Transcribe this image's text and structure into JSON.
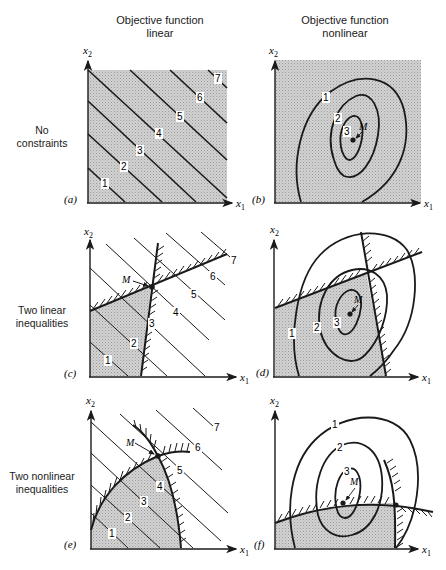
{
  "figure": {
    "column_headers": [
      {
        "line1": "Objective function",
        "line2": "linear"
      },
      {
        "line1": "Objective function",
        "line2": "nonlinear"
      }
    ],
    "row_headers": [
      {
        "line1": "No",
        "line2": "constraints"
      },
      {
        "line1": "Two linear",
        "line2": "inequalities"
      },
      {
        "line1": "Two nonlinear",
        "line2": "inequalities"
      }
    ],
    "axis_labels": {
      "x": "x",
      "x_sub": "1",
      "y": "x",
      "y_sub": "2"
    },
    "optimum_label": "M",
    "panels": [
      {
        "id": "a",
        "label": "(a)",
        "objective": "linear",
        "constraints": "none",
        "contour_labels": [
          "1",
          "2",
          "3",
          "4",
          "5",
          "6",
          "7"
        ]
      },
      {
        "id": "b",
        "label": "(b)",
        "objective": "nonlinear",
        "constraints": "none",
        "contour_labels": [
          "1",
          "2",
          "3"
        ]
      },
      {
        "id": "c",
        "label": "(c)",
        "objective": "linear",
        "constraints": "two linear inequalities",
        "contour_labels": [
          "1",
          "2",
          "3",
          "4",
          "5",
          "6",
          "7"
        ]
      },
      {
        "id": "d",
        "label": "(d)",
        "objective": "nonlinear",
        "constraints": "two linear inequalities",
        "contour_labels": [
          "1",
          "2",
          "3"
        ]
      },
      {
        "id": "e",
        "label": "(e)",
        "objective": "linear",
        "constraints": "two nonlinear inequalities",
        "contour_labels": [
          "1",
          "2",
          "3",
          "4",
          "5",
          "6",
          "7"
        ]
      },
      {
        "id": "f",
        "label": "(f)",
        "objective": "nonlinear",
        "constraints": "two nonlinear inequalities",
        "contour_labels": [
          "1",
          "2",
          "3"
        ]
      }
    ],
    "colors": {
      "ink": "#1a1a1a",
      "shade": "#c8c8c8",
      "paper": "#ffffff"
    }
  }
}
